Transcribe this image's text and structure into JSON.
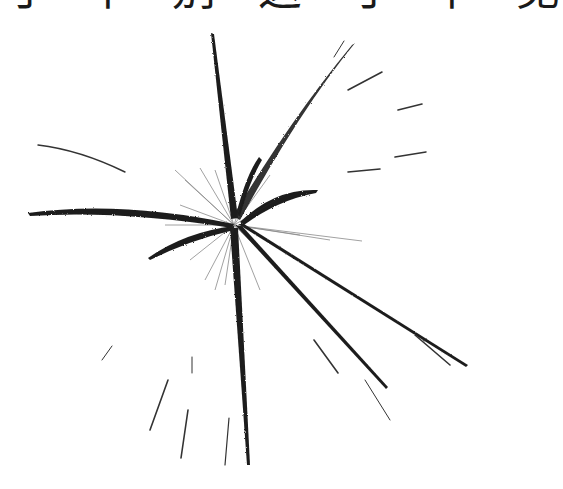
{
  "caption": {
    "text": "寸 中 别 这 寸 中 见",
    "note_visible_portion": "bottom edge only (cropped)"
  },
  "artwork": {
    "description": "ink brush burst / spiky radial strokes",
    "ink_color": "#1c1c1c",
    "background": "#ffffff",
    "center": [
      234,
      225
    ]
  }
}
